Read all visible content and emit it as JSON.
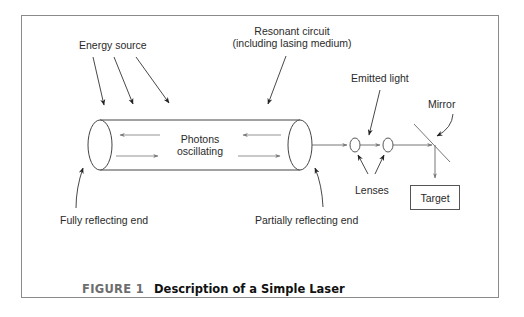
{
  "figure": {
    "number_label": "FIGURE 1",
    "title": "Description of a Simple Laser"
  },
  "labels": {
    "energy_source": "Energy source",
    "resonant_circuit_line1": "Resonant circuit",
    "resonant_circuit_line2": "(including lasing medium)",
    "photons_line1": "Photons",
    "photons_line2": "oscillating",
    "emitted_light": "Emitted light",
    "mirror": "Mirror",
    "lenses": "Lenses",
    "target": "Target",
    "fully_reflecting_end": "Fully reflecting end",
    "partially_reflecting_end": "Partially reflecting end"
  },
  "colors": {
    "frame": "#8a8a8a",
    "line": "#333333",
    "gray_arrow": "#7a7a7a",
    "text": "#2a2a2a",
    "caption_number": "#6d6d6d"
  }
}
